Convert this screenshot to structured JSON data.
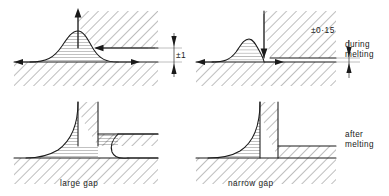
{
  "figure": {
    "background_color": "#ffffff",
    "line_color": "#1a1a1a"
  },
  "labels": {
    "dimension_left": "±1",
    "dimension_right": "±0·15",
    "row1_state_line1": "during",
    "row1_state_line2": "melting",
    "row2_state_line1": "after",
    "row2_state_line2": "melting",
    "caption_left": "large gap",
    "caption_right": "narrow gap"
  },
  "panels": [
    {
      "id": "top-left",
      "row": "during-melting",
      "gap": "large",
      "caption": "",
      "dimension": "±1",
      "arrows": [
        "up-arrow-at-joint",
        "left-arrow-upper-plate",
        "left-arrow-baseline",
        "right-arrow-baseline"
      ]
    },
    {
      "id": "top-right",
      "row": "during-melting",
      "gap": "narrow",
      "caption": "",
      "dimension": "±0·15",
      "arrows": [
        "down-arrow-at-joint",
        "left-arrow-baseline",
        "right-arrow-baseline"
      ]
    },
    {
      "id": "bottom-left",
      "row": "after-melting",
      "gap": "large",
      "caption": "large gap",
      "dimension": "",
      "arrows": []
    },
    {
      "id": "bottom-right",
      "row": "after-melting",
      "gap": "narrow",
      "caption": "narrow gap",
      "dimension": "",
      "arrows": []
    }
  ]
}
